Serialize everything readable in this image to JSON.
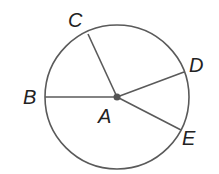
{
  "diagram": {
    "type": "circle-with-radii",
    "center": {
      "label": "A",
      "x": 117,
      "y": 97
    },
    "radius": 72,
    "points": [
      {
        "label": "B",
        "x": 45,
        "y": 97,
        "label_x": 23,
        "label_y": 104
      },
      {
        "label": "C",
        "x": 88,
        "y": 34,
        "label_x": 68,
        "label_y": 27
      },
      {
        "label": "D",
        "x": 184,
        "y": 72,
        "label_x": 189,
        "label_y": 72
      },
      {
        "label": "E",
        "x": 181,
        "y": 130,
        "label_x": 182,
        "label_y": 145
      }
    ],
    "center_label_pos": {
      "x": 98,
      "y": 123
    },
    "colors": {
      "stroke": "#5a5a5a",
      "dot": "#555555",
      "text": "#222222"
    }
  }
}
